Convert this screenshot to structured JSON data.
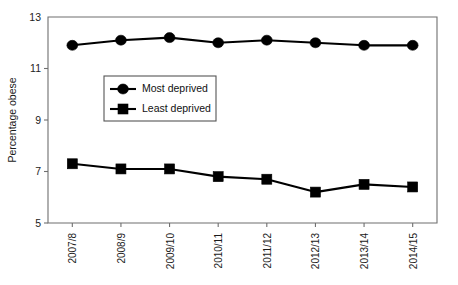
{
  "chart_data": {
    "type": "line",
    "title": "",
    "xlabel": "",
    "ylabel": "Percentage obese",
    "categories": [
      "2007/8",
      "2008/9",
      "2009/10",
      "2010/11",
      "2011/12",
      "2012/13",
      "2013/14",
      "2014/15"
    ],
    "series": [
      {
        "name": "Most deprived",
        "marker": "circle",
        "values": [
          11.9,
          12.1,
          12.2,
          12.0,
          12.1,
          12.0,
          11.9,
          11.9
        ]
      },
      {
        "name": "Least deprived",
        "marker": "square",
        "values": [
          7.3,
          7.1,
          7.1,
          6.8,
          6.7,
          6.2,
          6.5,
          6.4
        ]
      }
    ],
    "ylim": [
      5,
      13
    ],
    "yticks": [
      5,
      7,
      9,
      11,
      13
    ],
    "ytick_labels": [
      "5",
      "7",
      "9",
      "11",
      "13"
    ],
    "grid": false,
    "legend_position": "upper-center-left",
    "colors": {
      "series": "#000000",
      "axis": "#6f6f6f",
      "text": "#1a1a1a",
      "background": "#ffffff"
    }
  },
  "legend": {
    "entries": [
      {
        "label": "Most deprived",
        "marker": "circle"
      },
      {
        "label": "Least deprived",
        "marker": "square"
      }
    ]
  }
}
